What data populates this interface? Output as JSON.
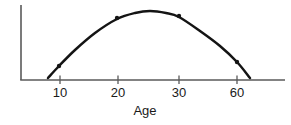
{
  "chart_data": {
    "type": "line",
    "title": "",
    "xlabel": "Age",
    "ylabel": "",
    "grid": false,
    "legend": null,
    "axis_style": "two-axis-open-left-bottom",
    "x_tick_labels": [
      "10",
      "20",
      "30",
      "60"
    ],
    "x_tick_positions_px": [
      60,
      118,
      179,
      237
    ],
    "curve_shape": "inverted-parabola",
    "curve_points_px": [
      [
        48,
        78
      ],
      [
        59,
        66
      ],
      [
        75,
        50
      ],
      [
        95,
        33
      ],
      [
        117,
        19
      ],
      [
        135,
        13
      ],
      [
        150,
        11
      ],
      [
        166,
        13
      ],
      [
        179,
        17
      ],
      [
        200,
        31
      ],
      [
        220,
        46
      ],
      [
        237,
        62
      ],
      [
        250,
        78
      ]
    ],
    "marker_points_px": [
      [
        59,
        66
      ],
      [
        117,
        18
      ],
      [
        179,
        16
      ],
      [
        237,
        62
      ]
    ],
    "series": [
      {
        "name": "age-response-curve",
        "x": [
          8,
          10,
          15,
          20,
          25,
          30,
          45,
          60,
          62
        ],
        "y": [
          2,
          14,
          35,
          62,
          72,
          66,
          40,
          18,
          2
        ]
      }
    ],
    "ylim": [
      0,
      80
    ],
    "curve_color": "#141414",
    "axis_color": "#5a5a5a",
    "text_color": "#1a1a1a"
  },
  "axis": {
    "y_axis_name": "y-axis-line",
    "x_axis_name": "x-axis-line"
  }
}
